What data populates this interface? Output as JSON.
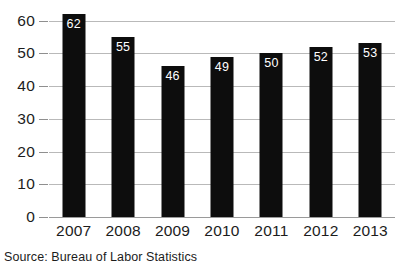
{
  "chart_data": {
    "type": "bar",
    "title": "",
    "xlabel": "",
    "ylabel": "",
    "categories": [
      "2007",
      "2008",
      "2009",
      "2010",
      "2011",
      "2012",
      "2013"
    ],
    "values": [
      62,
      55,
      46,
      49,
      50,
      52,
      53
    ],
    "data_labels": [
      "62",
      "55",
      "46",
      "49",
      "50",
      "52",
      "53"
    ],
    "ylim": [
      0,
      62
    ],
    "yticks": [
      0,
      10,
      20,
      30,
      40,
      50,
      60
    ],
    "ytick_labels": [
      "0",
      "10",
      "20",
      "30",
      "40",
      "50",
      "60"
    ],
    "grid": true,
    "legend": false,
    "bar_color": "#0d0d0d",
    "label_color": "#ffffff",
    "gridline_color": "#b9b9b9",
    "background_color": "#ffffff"
  },
  "figure": {
    "title_fragment": "",
    "source_note": "Source: Bureau of Labor Statistics"
  }
}
